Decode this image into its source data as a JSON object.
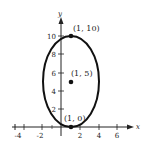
{
  "diagram": {
    "type": "ellipse-graph",
    "axes": {
      "x_label": "x",
      "y_label": "y",
      "x_ticks": [
        "-4",
        "-2",
        "2",
        "4",
        "6"
      ],
      "y_ticks": [
        "2",
        "4",
        "6",
        "8",
        "10"
      ]
    },
    "ellipse": {
      "center": [
        1,
        5
      ],
      "semi_major_vertical": 5,
      "semi_minor_horizontal": 3
    },
    "points": [
      {
        "label": "(1, 10)",
        "x": 1,
        "y": 10
      },
      {
        "label": "(1, 5)",
        "x": 1,
        "y": 5
      },
      {
        "label": "(1, 0)",
        "x": 1,
        "y": 0
      }
    ],
    "colors": {
      "stroke": "#111111",
      "text": "#222222"
    }
  }
}
